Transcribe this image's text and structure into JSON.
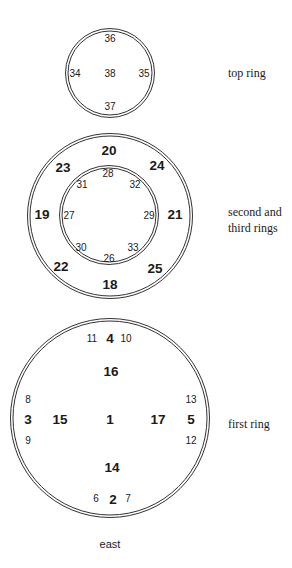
{
  "diagram": {
    "title": "",
    "colors": {
      "line": "#333333",
      "text": "#1a1a1a",
      "background": "#ffffff"
    },
    "rings": [
      {
        "id": "top-ring",
        "label": "top ring",
        "center": [
          110,
          73
        ],
        "radius": 44,
        "numbers": [
          {
            "value": "36",
            "pos": [
              110,
              38
            ],
            "size": "small"
          },
          {
            "value": "34",
            "pos": [
              75,
              73
            ],
            "size": "small"
          },
          {
            "value": "38",
            "pos": [
              110,
              73
            ],
            "size": "small"
          },
          {
            "value": "35",
            "pos": [
              144,
              73
            ],
            "size": "small"
          },
          {
            "value": "37",
            "pos": [
              110,
              106
            ],
            "size": "small"
          }
        ]
      },
      {
        "id": "second-ring",
        "label": "second and",
        "center": [
          110,
          216
        ],
        "radius": 82,
        "numbers": [
          {
            "value": "20",
            "pos": [
              109,
              150
            ],
            "size": "large"
          },
          {
            "value": "23",
            "pos": [
              63,
              167
            ],
            "size": "large"
          },
          {
            "value": "24",
            "pos": [
              157,
              165
            ],
            "size": "large"
          },
          {
            "value": "19",
            "pos": [
              42,
              214
            ],
            "size": "large"
          },
          {
            "value": "21",
            "pos": [
              175,
              214
            ],
            "size": "large"
          },
          {
            "value": "22",
            "pos": [
              61,
              266
            ],
            "size": "large"
          },
          {
            "value": "25",
            "pos": [
              155,
              268
            ],
            "size": "large"
          },
          {
            "value": "18",
            "pos": [
              110,
              284
            ],
            "size": "large"
          }
        ]
      },
      {
        "id": "third-ring",
        "label": "third rings",
        "center": [
          109,
          215
        ],
        "radius": 49,
        "numbers": [
          {
            "value": "28",
            "pos": [
              108,
              173
            ],
            "size": "small"
          },
          {
            "value": "31",
            "pos": [
              82,
              184
            ],
            "size": "small"
          },
          {
            "value": "32",
            "pos": [
              135,
              184
            ],
            "size": "small"
          },
          {
            "value": "27",
            "pos": [
              69,
              215
            ],
            "size": "small"
          },
          {
            "value": "29",
            "pos": [
              149,
              215
            ],
            "size": "small"
          },
          {
            "value": "30",
            "pos": [
              81,
              247
            ],
            "size": "small"
          },
          {
            "value": "33",
            "pos": [
              133,
              247
            ],
            "size": "small"
          },
          {
            "value": "26",
            "pos": [
              109,
              258
            ],
            "size": "small"
          }
        ]
      },
      {
        "id": "first-ring",
        "label": "first ring",
        "center": [
          110,
          418
        ],
        "radius": 99,
        "numbers": [
          {
            "value": "11",
            "pos": [
              92,
              338
            ],
            "size": "small"
          },
          {
            "value": "4",
            "pos": [
              110,
              338
            ],
            "size": "large"
          },
          {
            "value": "10",
            "pos": [
              126,
              338
            ],
            "size": "small"
          },
          {
            "value": "16",
            "pos": [
              111,
              371
            ],
            "size": "large"
          },
          {
            "value": "8",
            "pos": [
              28,
              399
            ],
            "size": "small"
          },
          {
            "value": "3",
            "pos": [
              28,
              419
            ],
            "size": "large"
          },
          {
            "value": "15",
            "pos": [
              60,
              419
            ],
            "size": "large"
          },
          {
            "value": "1",
            "pos": [
              110,
              419
            ],
            "size": "large"
          },
          {
            "value": "17",
            "pos": [
              158,
              419
            ],
            "size": "large"
          },
          {
            "value": "5",
            "pos": [
              191,
              419
            ],
            "size": "large"
          },
          {
            "value": "13",
            "pos": [
              191,
              399
            ],
            "size": "small"
          },
          {
            "value": "9",
            "pos": [
              28,
              440
            ],
            "size": "small"
          },
          {
            "value": "12",
            "pos": [
              191,
              440
            ],
            "size": "small"
          },
          {
            "value": "14",
            "pos": [
              112,
              467
            ],
            "size": "large"
          },
          {
            "value": "6",
            "pos": [
              96,
              498
            ],
            "size": "small"
          },
          {
            "value": "2",
            "pos": [
              113,
              499
            ],
            "size": "large"
          },
          {
            "value": "7",
            "pos": [
              128,
              498
            ],
            "size": "small"
          }
        ]
      }
    ],
    "labels": {
      "top_ring": "top ring",
      "second_line1": "second and",
      "second_line2": "third rings",
      "first_ring": "first ring",
      "direction": "east"
    }
  }
}
